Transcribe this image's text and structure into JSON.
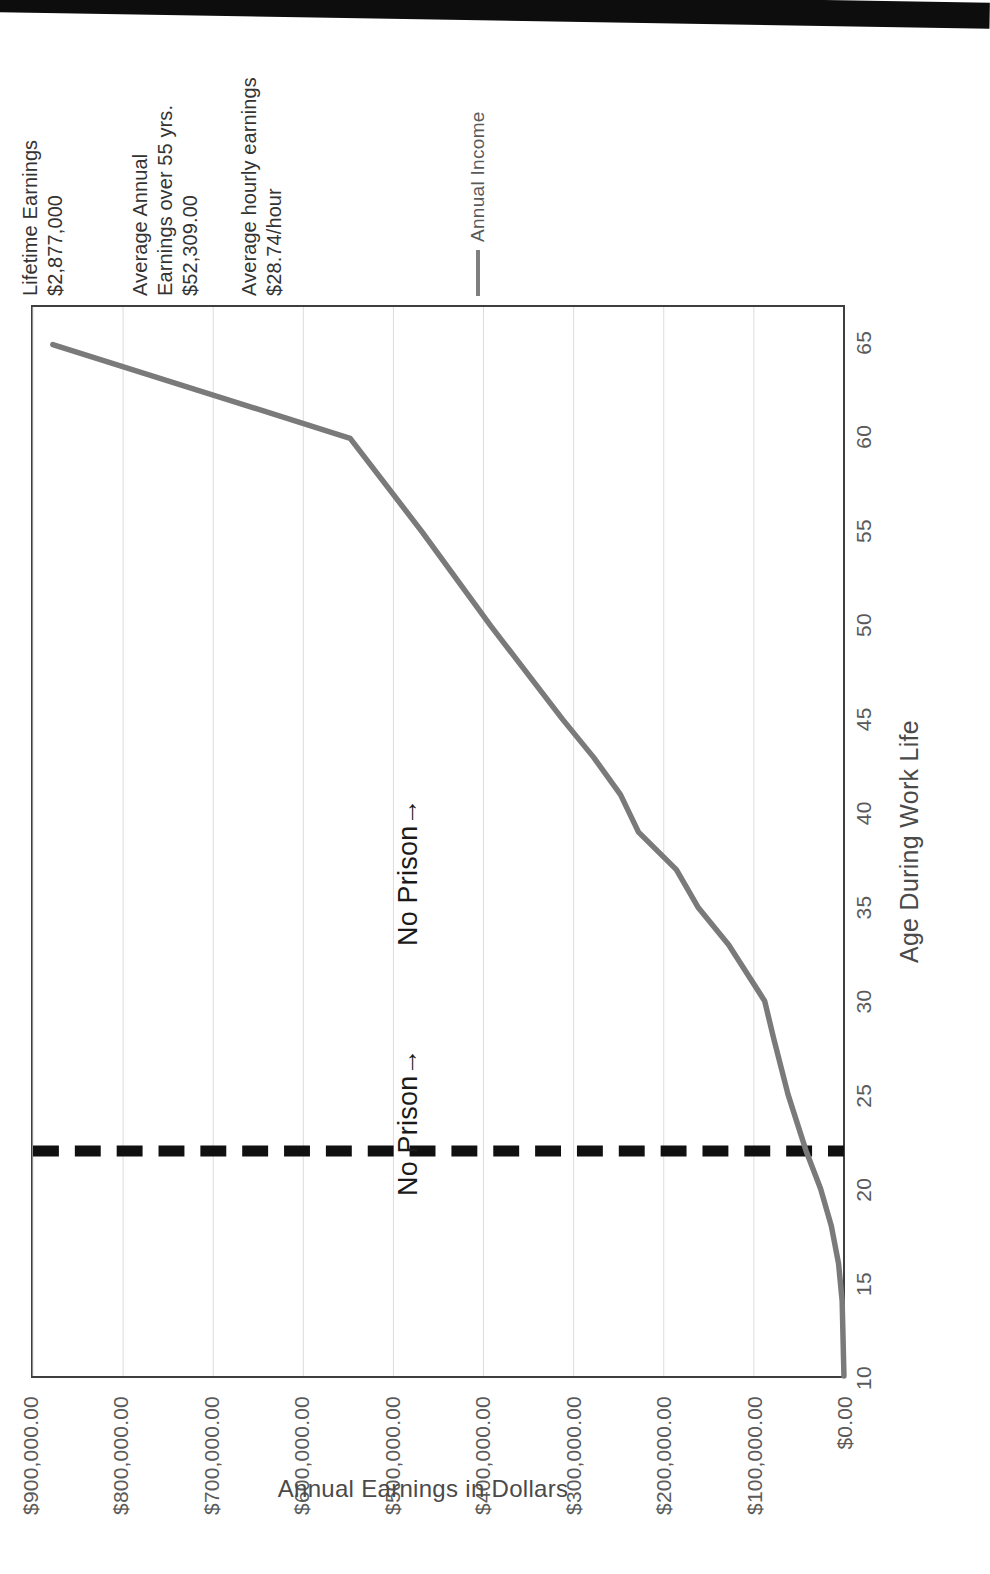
{
  "figure": {
    "annotations": [
      {
        "id": "lifetime",
        "name": "lifetime-earnings-note",
        "text": "Lifetime Earnings\n$2,877,000"
      },
      {
        "id": "avgannual",
        "name": "average-annual-earnings-note",
        "text": "Average Annual\nEarnings over 55  yrs.\n$52,309.00"
      },
      {
        "id": "hourly",
        "name": "average-hourly-earnings-note",
        "text": "Average hourly earnings\n$28.74/hour"
      }
    ],
    "legend": {
      "label": "Annual Income",
      "swatch_color": "#7f7f7f",
      "position": "top-right"
    },
    "plot_annotations": [
      {
        "id": "left",
        "text": "No Prison→"
      },
      {
        "id": "right",
        "text": "No Prison→"
      }
    ],
    "threshold": {
      "label": "",
      "age": 22,
      "color": "#101010",
      "style": "dashed"
    },
    "colors": {
      "series": "#7a7a7a",
      "grid": "#dcdcdc",
      "frame": "#3f3f3f",
      "threshold": "#101010",
      "text": "#4a4a4a"
    }
  },
  "chart_data": {
    "type": "line",
    "title": "",
    "xlabel": "Age During Work Life",
    "ylabel": "Annual Earnings in Dollars",
    "xlim": [
      10,
      67
    ],
    "ylim": [
      0,
      900000
    ],
    "xticks": [
      10,
      15,
      20,
      25,
      30,
      35,
      40,
      45,
      50,
      55,
      60,
      65
    ],
    "xtick_labels": [
      "10",
      "15",
      "20",
      "25",
      "30",
      "35",
      "40",
      "45",
      "50",
      "55",
      "60",
      "65"
    ],
    "yticks": [
      0,
      100000,
      200000,
      300000,
      400000,
      500000,
      600000,
      700000,
      800000,
      900000
    ],
    "ytick_labels": [
      "$0.00",
      "$100,000.00",
      "$200,000.00",
      "$300,000.00",
      "$400,000.00",
      "$500,000.00",
      "$600,000.00",
      "$700,000.00",
      "$800,000.00",
      "$900,000.00"
    ],
    "grid": true,
    "grid_axis": "y",
    "legend": [
      "Annual Income"
    ],
    "series": [
      {
        "name": "Annual Income",
        "color": "#7a7a7a",
        "x": [
          10,
          14,
          16,
          18,
          20,
          22,
          25,
          28,
          30,
          33,
          35,
          37,
          39,
          41,
          43,
          45,
          50,
          55,
          60,
          65
        ],
        "values": [
          0,
          2000,
          6000,
          14000,
          26000,
          42000,
          62000,
          78000,
          88000,
          128000,
          162000,
          186000,
          228000,
          248000,
          278000,
          312000,
          392000,
          468000,
          548000,
          878000
        ]
      }
    ],
    "annotations": [
      {
        "text": "Lifetime Earnings $2,877,000"
      },
      {
        "text": "Average Annual Earnings over 55  yrs. $52,309.00"
      },
      {
        "text": "Average hourly earnings $28.74/hour"
      },
      {
        "text": "No Prison→"
      },
      {
        "text": "No Prison→"
      }
    ]
  }
}
